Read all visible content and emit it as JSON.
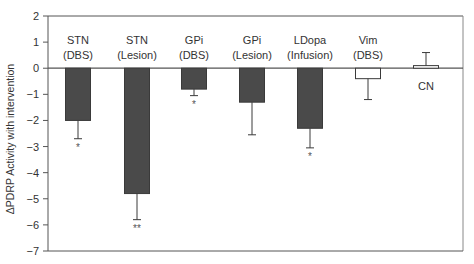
{
  "chart_data": {
    "type": "bar",
    "title": "",
    "xlabel": "",
    "ylabel": "ΔPDRP Activity with intervention",
    "ylim": [
      -7,
      2
    ],
    "yticks": [
      2,
      1,
      0,
      -1,
      -2,
      -3,
      -4,
      -5,
      -6,
      -7
    ],
    "ytick_labels": [
      "2",
      "1",
      "0",
      "−1",
      "−2",
      "−3",
      "−4",
      "−5",
      "−6",
      "−7"
    ],
    "grid": false,
    "legend": "none",
    "categories": [
      {
        "line1": "STN",
        "line2": "(DBS)"
      },
      {
        "line1": "STN",
        "line2": "(Lesion)"
      },
      {
        "line1": "GPi",
        "line2": "(DBS)"
      },
      {
        "line1": "GPi",
        "line2": "(Lesion)"
      },
      {
        "line1": "LDopa",
        "line2": "(Infusion)"
      },
      {
        "line1": "Vim",
        "line2": "(DBS)"
      },
      {
        "line1": "CN",
        "line2": ""
      }
    ],
    "values": [
      -2.0,
      -4.8,
      -0.8,
      -1.3,
      -2.3,
      -0.4,
      0.1
    ],
    "error": [
      0.7,
      1.0,
      0.25,
      1.25,
      0.75,
      0.8,
      0.5
    ],
    "significance": [
      "*",
      "**",
      "*",
      "",
      "*",
      "",
      ""
    ],
    "fill": [
      "dark",
      "dark",
      "dark",
      "dark",
      "dark",
      "white",
      "white"
    ],
    "colors": {
      "dark_bar": "#4a4a4a",
      "white_bar": "#ffffff",
      "axis": "#555555",
      "text": "#333333"
    }
  }
}
